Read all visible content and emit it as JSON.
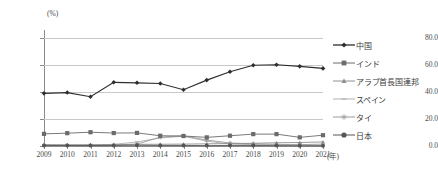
{
  "chart_data": {
    "type": "line",
    "title": "",
    "unit_label": "(%)",
    "xlabel": "(年)",
    "ylabel": "",
    "ylim": [
      0.0,
      80.0
    ],
    "yticks": [
      "0.0",
      "20.0",
      "40.0",
      "60.0",
      "80.0"
    ],
    "grid": true,
    "legend_position": "right",
    "categories": [
      "2009",
      "2010",
      "2011",
      "2012",
      "2013",
      "2014",
      "2015",
      "2016",
      "2017",
      "2018",
      "2019",
      "2020",
      "2021"
    ],
    "series": [
      {
        "name": "中国",
        "marker": "diamond",
        "color": "#2e2e2e",
        "values": [
          39.0,
          39.6,
          36.5,
          47.2,
          46.8,
          46.3,
          41.7,
          48.8,
          55.0,
          59.8,
          60.2,
          59.0,
          57.5
        ]
      },
      {
        "name": "インド",
        "marker": "square",
        "color": "#6b6b6b",
        "values": [
          9.0,
          9.5,
          10.2,
          9.6,
          9.7,
          7.6,
          7.4,
          6.4,
          7.6,
          8.8,
          8.8,
          6.4,
          8.0
        ]
      },
      {
        "name": "アラブ首長国連邦",
        "marker": "triangle",
        "color": "#8f8f8f",
        "values": [
          1.0,
          0.9,
          0.9,
          1.0,
          1.2,
          1.3,
          1.4,
          1.6,
          1.8,
          2.0,
          2.4,
          2.6,
          3.0
        ]
      },
      {
        "name": "スペイン",
        "marker": "dash",
        "color": "#b0b0b0",
        "values": [
          0.3,
          0.3,
          0.4,
          1.2,
          3.0,
          6.0,
          7.2,
          3.6,
          1.4,
          1.0,
          0.8,
          0.6,
          0.5
        ]
      },
      {
        "name": "タイ",
        "marker": "asterisk",
        "color": "#9a9a9a",
        "values": [
          0.5,
          0.5,
          0.6,
          0.8,
          1.4,
          6.6,
          7.5,
          4.4,
          2.2,
          1.6,
          1.2,
          1.0,
          1.4
        ]
      },
      {
        "name": "日本",
        "marker": "circle",
        "color": "#555555",
        "values": [
          0.4,
          0.4,
          0.4,
          0.4,
          0.5,
          0.4,
          0.4,
          0.3,
          0.4,
          0.4,
          0.3,
          0.2,
          0.2
        ]
      }
    ]
  }
}
